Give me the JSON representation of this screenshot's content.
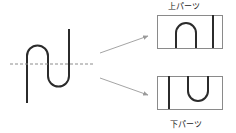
{
  "figure": {
    "type": "diagram",
    "title": "",
    "background_color": "#ffffff"
  },
  "colors": {
    "stroke": "#2b2b2b",
    "curve": "#2b2b2b",
    "dashed_line": "#8c8c8c",
    "arrow": "#9a9a9a",
    "frame": "#8a8a8a",
    "text": "#1b1b1b",
    "background": "#ffffff"
  },
  "labels": {
    "upper_parts": "上パーツ",
    "lower_parts": "下パーツ"
  },
  "source_shape": {
    "name": "s-curve",
    "stroke_width": 2,
    "path": "M 27 103 L 27 56 A 10.5 10.5 0 0 1 48 56 L 48 76 A 10.5 10.5 0 0 0 69 76 L 69 29",
    "center_line": {
      "y": 64,
      "x_start": 10,
      "x_end": 94,
      "dash": "3 2",
      "stroke_width": 1
    }
  },
  "arrows": [
    {
      "name": "arrow-to-upper",
      "x1": 100,
      "y1": 53,
      "x2": 148,
      "y2": 36
    },
    {
      "name": "arrow-to-lower",
      "x1": 100,
      "y1": 78,
      "x2": 148,
      "y2": 95
    }
  ],
  "panels": [
    {
      "name": "upper-part-panel",
      "label": "上パーツ",
      "label_position": "above",
      "frame": {
        "x": 157,
        "y": 15,
        "width": 65,
        "height": 33
      },
      "strokes": [
        {
          "name": "arch-stroke",
          "path": "M 176 48 L 176 33 A 10 10 0 0 1 196 33 L 196 48"
        },
        {
          "name": "vertical-stroke",
          "path": "M 213 15 L 213 48"
        }
      ]
    },
    {
      "name": "lower-part-panel",
      "label": "下パーツ",
      "label_position": "below",
      "frame": {
        "x": 157,
        "y": 76,
        "width": 65,
        "height": 33
      },
      "strokes": [
        {
          "name": "vertical-stroke",
          "path": "M 169 76 L 169 109"
        },
        {
          "name": "u-stroke",
          "path": "M 188 76 L 188 91 A 10 10 0 0 0 208 91 L 208 76"
        }
      ]
    }
  ]
}
